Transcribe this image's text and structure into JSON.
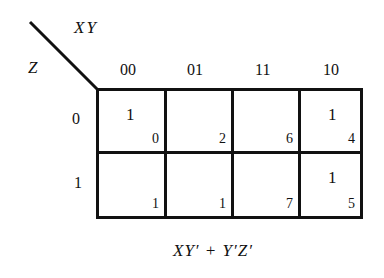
{
  "diagram": {
    "type": "karnaugh-map",
    "column_variables": "XY",
    "row_variable": "Z",
    "column_headers": [
      "00",
      "01",
      "11",
      "10"
    ],
    "row_headers": [
      "0",
      "1"
    ],
    "rows": [
      {
        "cells": [
          {
            "value": "1",
            "index": "0"
          },
          {
            "value": "",
            "index": "2"
          },
          {
            "value": "",
            "index": "6"
          },
          {
            "value": "1",
            "index": "4"
          }
        ]
      },
      {
        "cells": [
          {
            "value": "",
            "index": "1"
          },
          {
            "value": "",
            "index": "1"
          },
          {
            "value": "",
            "index": "7"
          },
          {
            "value": "1",
            "index": "5"
          }
        ]
      }
    ],
    "expression": "XY′ + Y′Z′",
    "colors": {
      "line": "#111111",
      "background": "#ffffff"
    }
  }
}
